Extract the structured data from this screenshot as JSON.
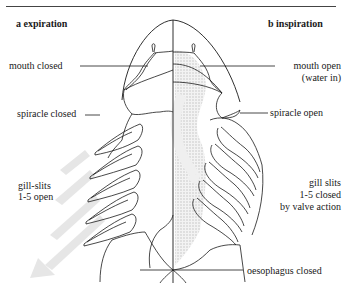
{
  "panels": {
    "left": {
      "letter": "a",
      "title": "a  expiration"
    },
    "right": {
      "letter": "b",
      "title": "b  inspiration"
    }
  },
  "labels": {
    "mouth_closed": "mouth closed",
    "mouth_open_1": "mouth open",
    "mouth_open_2": "(water in)",
    "spiracle_closed": "spiracle closed",
    "spiracle_open": "spiracle open",
    "gill_slits_open_1": "gill-slits",
    "gill_slits_open_2": "1-5 open",
    "gill_slits_closed_1": "gill slits",
    "gill_slits_closed_2": "1-5 closed",
    "gill_slits_closed_3": "by valve action",
    "oesophagus_closed": "oesophagus closed"
  },
  "colors": {
    "line": "#1a1a1a",
    "stipple": "#d8d8d8",
    "arrow": "#e4e4e4"
  }
}
